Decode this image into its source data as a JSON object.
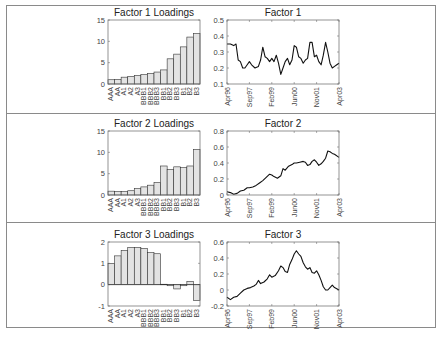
{
  "chart_data": [
    {
      "id": "factor1-loadings",
      "type": "bar",
      "title": "Factor 1 Loadings",
      "categories": [
        "AAA",
        "AA",
        "A1",
        "A2",
        "A3",
        "BBB1",
        "BBB2",
        "BBB3",
        "BB1",
        "BB2",
        "BB3",
        "B1",
        "B2",
        "B3"
      ],
      "values": [
        1.0,
        1.1,
        1.6,
        1.8,
        2.0,
        2.2,
        2.5,
        2.8,
        3.3,
        5.9,
        7.0,
        8.7,
        11.0,
        11.8
      ],
      "ylim": [
        0,
        15
      ],
      "yticks": [
        0,
        5,
        10,
        15
      ],
      "xlabel": "",
      "ylabel": "",
      "bar_color": "#e3e3e3"
    },
    {
      "id": "factor1-series",
      "type": "line",
      "title": "Factor 1",
      "xticks": [
        "Apr96",
        "Sep97",
        "Feb99",
        "Jun00",
        "Nov01",
        "Apr03"
      ],
      "ylim": [
        0.1,
        0.5
      ],
      "yticks": [
        0.1,
        0.2,
        0.3,
        0.4,
        0.5
      ],
      "x": [
        0,
        0.03,
        0.06,
        0.08,
        0.1,
        0.12,
        0.14,
        0.16,
        0.18,
        0.2,
        0.22,
        0.25,
        0.28,
        0.3,
        0.32,
        0.34,
        0.36,
        0.38,
        0.4,
        0.42,
        0.44,
        0.46,
        0.48,
        0.5,
        0.52,
        0.54,
        0.56,
        0.58,
        0.6,
        0.62,
        0.64,
        0.66,
        0.68,
        0.7,
        0.72,
        0.74,
        0.76,
        0.78,
        0.8,
        0.82,
        0.84,
        0.86,
        0.88,
        0.9,
        0.92,
        0.94,
        0.96,
        0.98,
        1.0
      ],
      "values": [
        0.35,
        0.35,
        0.34,
        0.35,
        0.25,
        0.24,
        0.2,
        0.2,
        0.22,
        0.24,
        0.22,
        0.2,
        0.21,
        0.25,
        0.33,
        0.27,
        0.26,
        0.24,
        0.26,
        0.24,
        0.28,
        0.23,
        0.16,
        0.2,
        0.24,
        0.26,
        0.22,
        0.25,
        0.34,
        0.33,
        0.27,
        0.26,
        0.23,
        0.25,
        0.26,
        0.36,
        0.36,
        0.27,
        0.28,
        0.24,
        0.22,
        0.28,
        0.36,
        0.3,
        0.23,
        0.2,
        0.21,
        0.22,
        0.23
      ],
      "xlabel": "",
      "ylabel": "",
      "line_color": "#111111"
    },
    {
      "id": "factor2-loadings",
      "type": "bar",
      "title": "Factor 2 Loadings",
      "categories": [
        "AAA",
        "AA",
        "A1",
        "A2",
        "A3",
        "BBB1",
        "BBB2",
        "BBB3",
        "BB1",
        "BB2",
        "BB3",
        "B1",
        "B2",
        "B3"
      ],
      "values": [
        0.9,
        0.8,
        0.8,
        1.0,
        1.5,
        1.9,
        2.3,
        2.9,
        6.8,
        6.0,
        6.6,
        6.4,
        6.8,
        10.7
      ],
      "ylim": [
        0,
        15
      ],
      "yticks": [
        0,
        5,
        10,
        15
      ],
      "xlabel": "",
      "ylabel": "",
      "bar_color": "#e3e3e3"
    },
    {
      "id": "factor2-series",
      "type": "line",
      "title": "Factor 2",
      "xticks": [
        "Apr96",
        "Sep97",
        "Feb99",
        "Jun00",
        "Nov01",
        "Apr03"
      ],
      "ylim": [
        0,
        0.8
      ],
      "yticks": [
        0,
        0.2,
        0.4,
        0.6,
        0.8
      ],
      "x": [
        0,
        0.03,
        0.06,
        0.09,
        0.12,
        0.15,
        0.18,
        0.2,
        0.23,
        0.26,
        0.29,
        0.32,
        0.35,
        0.38,
        0.4,
        0.42,
        0.45,
        0.48,
        0.5,
        0.52,
        0.55,
        0.58,
        0.6,
        0.62,
        0.65,
        0.68,
        0.7,
        0.72,
        0.74,
        0.76,
        0.78,
        0.8,
        0.82,
        0.84,
        0.86,
        0.88,
        0.9,
        0.92,
        0.94,
        0.96,
        1.0
      ],
      "values": [
        0.04,
        0.03,
        0.01,
        0.02,
        0.05,
        0.06,
        0.09,
        0.09,
        0.1,
        0.12,
        0.15,
        0.18,
        0.22,
        0.26,
        0.25,
        0.23,
        0.21,
        0.24,
        0.33,
        0.31,
        0.36,
        0.38,
        0.4,
        0.4,
        0.41,
        0.42,
        0.41,
        0.37,
        0.38,
        0.42,
        0.44,
        0.41,
        0.37,
        0.39,
        0.42,
        0.46,
        0.55,
        0.54,
        0.52,
        0.51,
        0.47
      ],
      "xlabel": "",
      "ylabel": "",
      "line_color": "#111111"
    },
    {
      "id": "factor3-loadings",
      "type": "bar",
      "title": "Factor 3 Loadings",
      "categories": [
        "AAA",
        "AA",
        "A1",
        "A2",
        "A3",
        "BBB1",
        "BBB2",
        "BBB3",
        "BB1",
        "BB2",
        "BB3",
        "B1",
        "B2",
        "B3"
      ],
      "values": [
        1.0,
        1.35,
        1.6,
        1.75,
        1.75,
        1.7,
        1.5,
        1.45,
        0.02,
        -0.05,
        -0.2,
        -0.05,
        0.15,
        -0.75
      ],
      "ylim": [
        -1,
        2
      ],
      "yticks": [
        -1,
        0,
        1,
        2
      ],
      "xlabel": "",
      "ylabel": "",
      "bar_color": "#e3e3e3"
    },
    {
      "id": "factor3-series",
      "type": "line",
      "title": "Factor 3",
      "xticks": [
        "Apr96",
        "Sep97",
        "Feb99",
        "Jun00",
        "Nov01",
        "Apr03"
      ],
      "ylim": [
        -0.2,
        0.6
      ],
      "yticks": [
        -0.2,
        0,
        0.2,
        0.4,
        0.6
      ],
      "x": [
        0,
        0.03,
        0.06,
        0.09,
        0.12,
        0.15,
        0.18,
        0.21,
        0.24,
        0.26,
        0.28,
        0.3,
        0.33,
        0.36,
        0.38,
        0.4,
        0.43,
        0.46,
        0.48,
        0.5,
        0.52,
        0.54,
        0.56,
        0.58,
        0.6,
        0.62,
        0.64,
        0.66,
        0.68,
        0.7,
        0.72,
        0.74,
        0.76,
        0.78,
        0.8,
        0.82,
        0.84,
        0.86,
        0.88,
        0.9,
        0.92,
        0.94,
        0.96,
        1.0
      ],
      "values": [
        -0.09,
        -0.12,
        -0.09,
        -0.08,
        -0.04,
        0.0,
        0.02,
        0.03,
        0.05,
        0.07,
        0.12,
        0.08,
        0.1,
        0.14,
        0.19,
        0.16,
        0.18,
        0.24,
        0.3,
        0.28,
        0.23,
        0.22,
        0.32,
        0.38,
        0.45,
        0.49,
        0.45,
        0.42,
        0.34,
        0.29,
        0.26,
        0.28,
        0.22,
        0.21,
        0.24,
        0.19,
        0.12,
        0.04,
        0.0,
        0.0,
        0.03,
        0.06,
        0.03,
        0.0
      ],
      "xlabel": "",
      "ylabel": "",
      "line_color": "#111111"
    }
  ],
  "rows": [
    {
      "bar_title": "Factor 1 Loadings",
      "line_title": "Factor 1"
    },
    {
      "bar_title": "Factor 2 Loadings",
      "line_title": "Factor 2"
    },
    {
      "bar_title": "Factor 3 Loadings",
      "line_title": "Factor 3"
    }
  ]
}
